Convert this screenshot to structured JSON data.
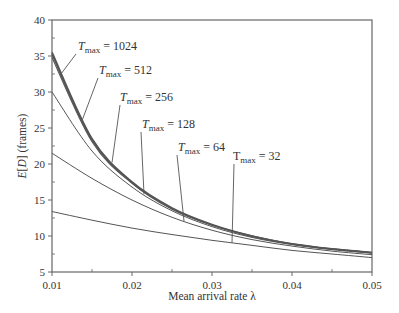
{
  "chart_data": {
    "type": "line",
    "title": "",
    "xlabel": "Mean arrival rate λ",
    "ylabel": "E[D] (frames)",
    "xlim": [
      0.01,
      0.05
    ],
    "ylim": [
      5,
      40
    ],
    "x_ticks": [
      "0.01",
      "0.02",
      "0.03",
      "0.04",
      "0.05"
    ],
    "y_ticks": [
      "5",
      "10",
      "15",
      "20",
      "25",
      "30",
      "35",
      "40"
    ],
    "grid": false,
    "legend": "inline annotations",
    "x": [
      0.01,
      0.015,
      0.02,
      0.025,
      0.03,
      0.035,
      0.04,
      0.045,
      0.05
    ],
    "series": [
      {
        "name": "T_max = 1024",
        "values": [
          35.5,
          23.5,
          17.5,
          13.9,
          11.6,
          10.0,
          8.9,
          8.2,
          7.7
        ]
      },
      {
        "name": "T_max = 512",
        "values": [
          35.2,
          23.3,
          17.4,
          13.8,
          11.5,
          10.0,
          8.9,
          8.2,
          7.7
        ]
      },
      {
        "name": "T_max = 256",
        "values": [
          34.8,
          23.1,
          17.3,
          13.7,
          11.5,
          9.9,
          8.9,
          8.2,
          7.7
        ]
      },
      {
        "name": "T_max = 128",
        "values": [
          30.0,
          21.8,
          16.8,
          13.5,
          11.3,
          9.8,
          8.8,
          8.1,
          7.6
        ]
      },
      {
        "name": "T_max = 64",
        "values": [
          21.5,
          18.0,
          15.0,
          12.6,
          10.8,
          9.5,
          8.6,
          7.9,
          7.4
        ]
      },
      {
        "name": "T_max = 32",
        "values": [
          13.4,
          12.2,
          11.1,
          10.2,
          9.4,
          8.7,
          8.0,
          7.5,
          7.0
        ]
      }
    ],
    "annotations": [
      {
        "text_main": "T",
        "text_sub": "max",
        "text_val": "= 1024",
        "series": "T_max = 1024"
      },
      {
        "text_main": "T",
        "text_sub": "max",
        "text_val": "= 512",
        "series": "T_max = 512"
      },
      {
        "text_main": "T",
        "text_sub": "max",
        "text_val": "= 256",
        "series": "T_max = 256"
      },
      {
        "text_main": "T",
        "text_sub": "max",
        "text_val": "= 128",
        "series": "T_max = 128"
      },
      {
        "text_main": "T",
        "text_sub": "max",
        "text_val": "= 64",
        "series": "T_max = 64"
      },
      {
        "text_main": "T",
        "text_sub": "max",
        "text_val": "= 32",
        "series": "T_max = 32"
      }
    ]
  },
  "style": {
    "line_color": "#555555",
    "axis_color": "#666666",
    "text_color": "#333333"
  }
}
